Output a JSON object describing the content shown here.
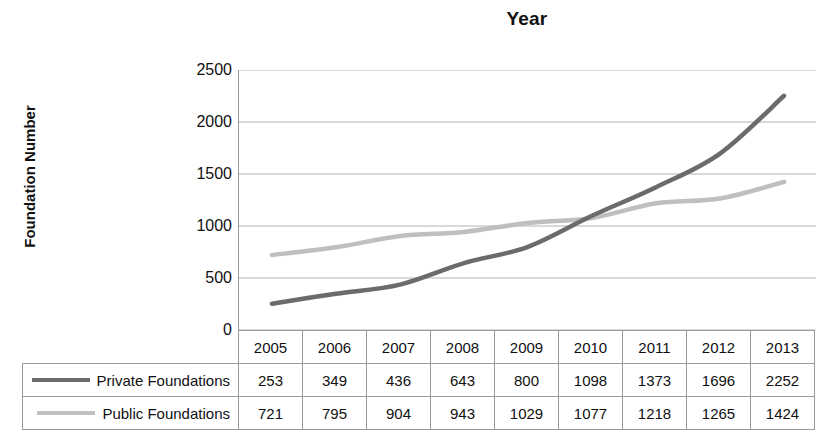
{
  "chart_data": {
    "type": "line",
    "title": "Year",
    "xlabel": "",
    "ylabel": "Foundation Number",
    "categories": [
      "2005",
      "2006",
      "2007",
      "2008",
      "2009",
      "2010",
      "2011",
      "2012",
      "2013"
    ],
    "series": [
      {
        "name": "Private Foundations",
        "color": "#6b6b6b",
        "values": [
          253,
          349,
          436,
          643,
          800,
          1098,
          1373,
          1696,
          2252
        ]
      },
      {
        "name": "Public Foundations",
        "color": "#bfbfbf",
        "values": [
          721,
          795,
          904,
          943,
          1029,
          1077,
          1218,
          1265,
          1424
        ]
      }
    ],
    "ylim": [
      0,
      2500
    ],
    "yticks": [
      "0",
      "500",
      "1000",
      "1500",
      "2000",
      "2500"
    ],
    "ytick_values": [
      0,
      500,
      1000,
      1500,
      2000,
      2500
    ],
    "grid": true,
    "legend_position": "data-table-below",
    "has_data_table": true,
    "gridline_color": "#b3b3b3",
    "axis_color": "#9a9a9a"
  },
  "table": {
    "corner_label": "",
    "year_headers": [
      "2005",
      "2006",
      "2007",
      "2008",
      "2009",
      "2010",
      "2011",
      "2012",
      "2013"
    ],
    "rows": [
      {
        "label": "Private Foundations",
        "swatch_color": "#6b6b6b",
        "values": [
          "253",
          "349",
          "436",
          "643",
          "800",
          "1098",
          "1373",
          "1696",
          "2252"
        ]
      },
      {
        "label": "Public Foundations",
        "swatch_color": "#bfbfbf",
        "values": [
          "721",
          "795",
          "904",
          "943",
          "1029",
          "1077",
          "1218",
          "1265",
          "1424"
        ]
      }
    ]
  }
}
